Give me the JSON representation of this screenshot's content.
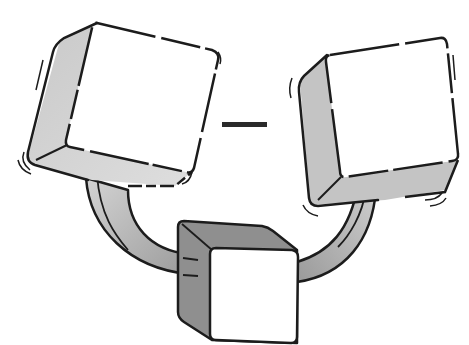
{
  "illustration": {
    "subject": "Three cubes connected by curved gray arms, with a minus sign between the two upper cubes",
    "elements": [
      {
        "name": "left-cube",
        "face": "white",
        "sides": "light gray"
      },
      {
        "name": "right-cube",
        "face": "white",
        "sides": "light gray"
      },
      {
        "name": "bottom-cube",
        "face": "white",
        "sides": "medium gray"
      },
      {
        "name": "minus-sign",
        "symbol": "−"
      }
    ],
    "colors": {
      "outline": "#1c1c1c",
      "face": "#ffffff",
      "side_light": "#cfcfcf",
      "side_mid": "#b9b9b9",
      "side_dark": "#8f8f8f",
      "arm": "#b5b5b5",
      "background": "#ffffff"
    }
  }
}
